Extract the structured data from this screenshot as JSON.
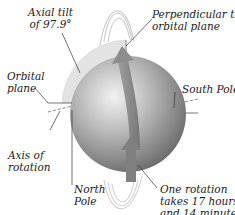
{
  "diagram": {
    "labels": {
      "axial_tilt": {
        "line1": "Axial tilt",
        "line2": "of 97.9°"
      },
      "perpendicular": {
        "line1": "Perpendicular to",
        "line2": "orbital plane"
      },
      "orbital_plane": {
        "line1": "Orbital",
        "line2": "plane"
      },
      "south_pole": {
        "line1": "South Pole"
      },
      "axis_of_rotation": {
        "line1": "Axis of",
        "line2": "rotation"
      },
      "north_pole": {
        "line1": "North",
        "line2": "Pole"
      },
      "one_rotation": {
        "line1": "One rotation",
        "line2": "takes 17 hours",
        "line3": "and 14 minutes"
      }
    },
    "colors": {
      "planet_light": "#e6e6e6",
      "planet_mid": "#a9a9a9",
      "planet_dark": "#6e6e6e",
      "tilt_wedge": "#e4e4e4",
      "arrow": "#8a8a8a",
      "leader_line": "#333333",
      "ring": "#c8c8c8"
    }
  }
}
